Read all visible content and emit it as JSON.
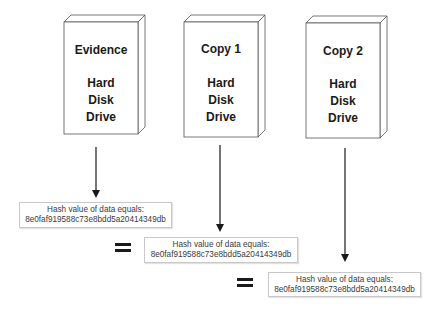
{
  "drives": [
    {
      "title": "Evidence",
      "lines": [
        "Hard",
        "Disk",
        "Drive"
      ]
    },
    {
      "title": "Copy 1",
      "lines": [
        "Hard",
        "Disk",
        "Drive"
      ]
    },
    {
      "title": "Copy 2",
      "lines": [
        "Hard",
        "Disk",
        "Drive"
      ]
    }
  ],
  "hashes": [
    {
      "label": "Hash value of data equals:",
      "value": "8e0faf919588c73e8bdd5a20414349db"
    },
    {
      "label": "Hash value of data equals:",
      "value": "8e0faf919588c73e8bdd5a20414349db"
    },
    {
      "label": "Hash value of data equals:",
      "value": "8e0faf919588c73e8bdd5a20414349db"
    }
  ],
  "equals_symbol": "="
}
